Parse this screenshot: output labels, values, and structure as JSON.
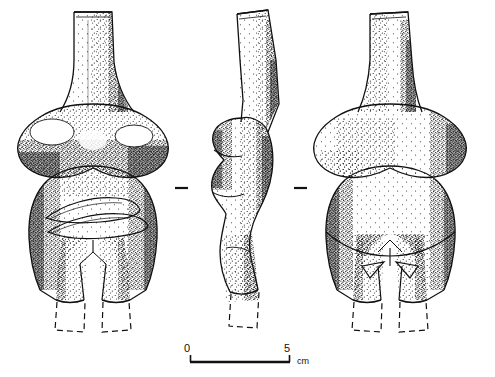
{
  "plate": {
    "background_color": "#ffffff",
    "ink_color": "#111111",
    "technique": "stipple",
    "object": "anthropomorphic figurine",
    "view_count": 3
  },
  "views": [
    {
      "id": "front-view",
      "label": "front",
      "features": [
        "columnar neck",
        "shoulder bulges",
        "breasts with highlight",
        "incised folded-arm lenses",
        "tapered legs",
        "reconstructed feet"
      ]
    },
    {
      "id": "profile-view",
      "label": "profile",
      "features": [
        "backward tilted neck",
        "projecting breast",
        "undulating torso",
        "buttock bulge",
        "reconstructed foot"
      ]
    },
    {
      "id": "back-view",
      "label": "back",
      "features": [
        "columnar neck",
        "shoulder bulges",
        "rounded buttocks",
        "incised chevron marks",
        "central cleft",
        "reconstructed feet"
      ]
    }
  ],
  "separators": [
    {
      "name": "separator-left",
      "x": 175,
      "y": 188,
      "length": 13
    },
    {
      "name": "separator-right",
      "x": 294,
      "y": 188,
      "length": 13
    }
  ],
  "scale_bar": {
    "start_label": "0",
    "end_label": "5",
    "unit": "cm",
    "bar_x_start": 190,
    "bar_x_end": 290,
    "bar_y": 362,
    "length_cm": 5
  }
}
